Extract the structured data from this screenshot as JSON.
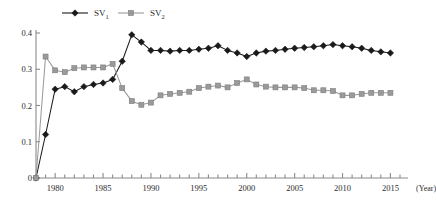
{
  "chart_data": {
    "type": "line",
    "title": "",
    "subtitle": "",
    "xlabel": "(Year)",
    "ylabel": "",
    "xlim": [
      1978,
      2016
    ],
    "ylim": [
      0,
      0.4
    ],
    "grid": false,
    "legend_position": "top-center",
    "x_ticks": [
      1980,
      1985,
      1990,
      1995,
      2000,
      2005,
      2010,
      2015
    ],
    "x_tick_labels": [
      "1980",
      "1985",
      "1990",
      "1995",
      "2000",
      "2005",
      "2010",
      "2015"
    ],
    "y_ticks": [
      0,
      0.1,
      0.2,
      0.3,
      0.4
    ],
    "y_tick_labels": [
      "0",
      "0.1",
      "0.2",
      "0.3",
      "0.4"
    ],
    "x": [
      1978,
      1979,
      1980,
      1981,
      1982,
      1983,
      1984,
      1985,
      1986,
      1987,
      1988,
      1989,
      1990,
      1991,
      1992,
      1993,
      1994,
      1995,
      1996,
      1997,
      1998,
      1999,
      2000,
      2001,
      2002,
      2003,
      2004,
      2005,
      2006,
      2007,
      2008,
      2009,
      2010,
      2011,
      2012,
      2013,
      2014,
      2015
    ],
    "series": [
      {
        "name": "SV1",
        "label": "SV",
        "subscript": "1",
        "color": "#1a1a1a",
        "marker": "diamond",
        "values": [
          0.0,
          0.12,
          0.245,
          0.252,
          0.238,
          0.252,
          0.258,
          0.262,
          0.272,
          0.322,
          0.395,
          0.375,
          0.352,
          0.352,
          0.35,
          0.352,
          0.352,
          0.355,
          0.358,
          0.365,
          0.352,
          0.345,
          0.335,
          0.345,
          0.35,
          0.352,
          0.355,
          0.358,
          0.36,
          0.362,
          0.365,
          0.368,
          0.365,
          0.362,
          0.358,
          0.352,
          0.348,
          0.345
        ]
      },
      {
        "name": "SV2",
        "label": "SV",
        "subscript": "2",
        "color": "#9a9a9a",
        "marker": "square",
        "values": [
          0.0,
          0.335,
          0.297,
          0.292,
          0.303,
          0.305,
          0.305,
          0.305,
          0.315,
          0.248,
          0.212,
          0.202,
          0.208,
          0.228,
          0.232,
          0.235,
          0.238,
          0.248,
          0.252,
          0.255,
          0.25,
          0.262,
          0.272,
          0.258,
          0.252,
          0.25,
          0.25,
          0.25,
          0.248,
          0.242,
          0.242,
          0.24,
          0.228,
          0.228,
          0.232,
          0.235,
          0.235,
          0.235
        ]
      }
    ],
    "legend": [
      {
        "name": "SV1",
        "label": "SV",
        "subscript": "1",
        "color": "#1a1a1a",
        "marker": "diamond"
      },
      {
        "name": "SV2",
        "label": "SV",
        "subscript": "2",
        "color": "#9a9a9a",
        "marker": "square"
      }
    ],
    "axis_color": "#8a8a8a"
  }
}
